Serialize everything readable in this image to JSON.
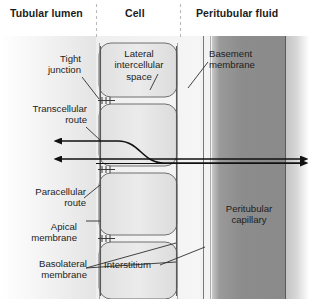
{
  "diagram": {
    "title_columns": [
      {
        "id": "tubular-lumen",
        "label": "Tubular lumen"
      },
      {
        "id": "cell",
        "label": "Cell"
      },
      {
        "id": "peritubular-fluid",
        "label": "Peritubular fluid"
      }
    ],
    "labels": [
      {
        "id": "tight-junction",
        "line1": "Tight",
        "line2": "junction"
      },
      {
        "id": "transcellular-route",
        "line1": "Transcellular",
        "line2": "route"
      },
      {
        "id": "paracellular-route",
        "line1": "Paracellular",
        "line2": "route"
      },
      {
        "id": "apical-membrane",
        "line1": "Apical",
        "line2": "membrane"
      },
      {
        "id": "basolateral-membrane",
        "line1": "Basolateral",
        "line2": "membrane"
      },
      {
        "id": "lateral-intercellular-space",
        "line1": "Lateral",
        "line2": "intercellular",
        "line3": "space"
      },
      {
        "id": "basement-membrane",
        "line1": "Basement",
        "line2": "membrane"
      },
      {
        "id": "interstitium",
        "line1": "Interstitium"
      },
      {
        "id": "peritubular-capillary",
        "line1": "Peritubular",
        "line2": "capillary"
      }
    ],
    "colors": {
      "text": "#1d1d1d",
      "header_text": "#1b1b1b",
      "lumen_fill": "#ebebeb",
      "cell_fill": "#e3e3e3",
      "capillary_fill": "#8a8a8a",
      "capillary_edge": "#bdbdbd",
      "stroke": "#4a4a4a",
      "route_stroke": "#111111",
      "divider": "#b9b9b9"
    },
    "routes": [
      {
        "id": "transcellular-route-path",
        "direction": "bidirectional",
        "style": "s-curve-through-cell"
      },
      {
        "id": "paracellular-route-path",
        "direction": "bidirectional",
        "style": "straight-between-cells"
      }
    ]
  }
}
